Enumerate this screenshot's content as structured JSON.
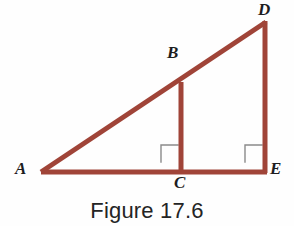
{
  "figure": {
    "caption": "Figure 17.6",
    "background_color": "#fefefe",
    "line_color": "#a04438",
    "label_color": "#1d1d1f",
    "right_angle_color": "#8a8a8a"
  },
  "labels": {
    "a": "A",
    "b": "B",
    "c": "C",
    "d": "D",
    "e": "E"
  },
  "chart_data": {
    "type": "diagram",
    "title": "Figure 17.6",
    "points": [
      {
        "name": "A",
        "x": 41,
        "y": 172
      },
      {
        "name": "B",
        "x": 181,
        "y": 82
      },
      {
        "name": "C",
        "x": 181,
        "y": 172
      },
      {
        "name": "D",
        "x": 265,
        "y": 21
      },
      {
        "name": "E",
        "x": 265,
        "y": 172
      }
    ],
    "segments": [
      {
        "from": "A",
        "to": "E",
        "role": "base"
      },
      {
        "from": "A",
        "to": "D",
        "role": "hypotenuse"
      },
      {
        "from": "B",
        "to": "C",
        "role": "inner-vertical"
      },
      {
        "from": "D",
        "to": "E",
        "role": "outer-vertical"
      }
    ],
    "right_angles": [
      {
        "at": "C",
        "between": [
          "A",
          "B"
        ]
      },
      {
        "at": "E",
        "between": [
          "C",
          "D"
        ]
      }
    ],
    "stroke_width": 5,
    "legend": "none",
    "grid": false
  }
}
